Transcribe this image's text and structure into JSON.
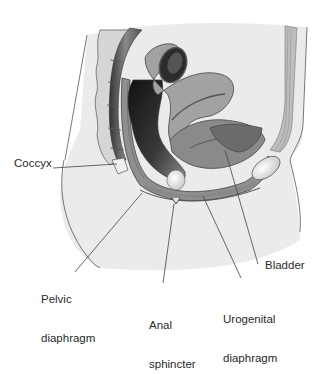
{
  "diagram": {
    "title": "",
    "labels": {
      "coccyx": "Coccyx",
      "pelvic_diaphragm_1": "Pelvic",
      "pelvic_diaphragm_2": "diaphragm",
      "anal_sphincter_1": "Anal",
      "anal_sphincter_2": "sphincter",
      "urogenital_diaphragm_1": "Urogenital",
      "urogenital_diaphragm_2": "diaphragm",
      "bladder": "Bladder"
    },
    "colors": {
      "skin": "#ebebeb",
      "outline": "#555555",
      "muscle": "#9a9a9a",
      "dark": "#2b2b2b",
      "mid": "#7d7d7d",
      "light_organ": "#c8c8c8",
      "leader": "#444444"
    }
  }
}
